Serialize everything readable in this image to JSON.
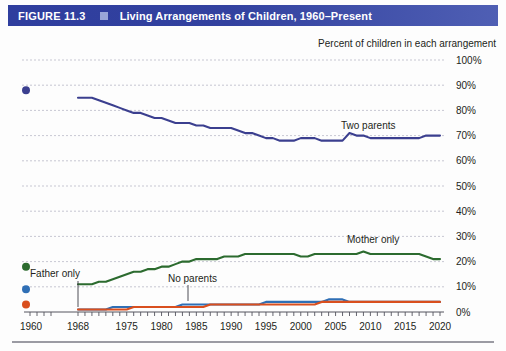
{
  "header": {
    "figure_number": "FIGURE 11.3",
    "bullet_icon": "square-bullet-icon",
    "title": "Living Arrangements of Children, 1960–Present",
    "band_color": "#32419f",
    "bullet_color": "#9aa7d8",
    "text_color": "#ffffff"
  },
  "subtitle": "Percent of children in each arrangement",
  "annotations": {
    "two_parents": "Two parents",
    "mother_only": "Mother only",
    "father_only": "Father only",
    "no_parents": "No parents"
  },
  "chart_data": {
    "type": "line",
    "title": "Living Arrangements of Children, 1960–Present",
    "subtitle": "Percent of children in each arrangement",
    "xlabel": "",
    "ylabel": "Percent of children in each arrangement",
    "ylim": [
      0,
      100
    ],
    "ytick_labels": [
      "0%",
      "10%",
      "20%",
      "30%",
      "40%",
      "50%",
      "60%",
      "70%",
      "80%",
      "90%",
      "100%"
    ],
    "ytick_values": [
      0,
      10,
      20,
      30,
      40,
      50,
      60,
      70,
      80,
      90,
      100
    ],
    "xtick_labels": [
      "1960",
      "1968",
      "1975",
      "1980",
      "1985",
      "1990",
      "1995",
      "2000",
      "2005",
      "2010",
      "2015",
      "2020"
    ],
    "xtick_values": [
      1960,
      1968,
      1975,
      1980,
      1985,
      1990,
      1995,
      2000,
      2005,
      2010,
      2015,
      2020
    ],
    "axis_break": "gap between 1960 and 1968",
    "grid": "horizontal dotted gridlines only",
    "legend_position": "inline annotations on plot",
    "colors": {
      "two_parents": "#3b3f8f",
      "mother_only": "#2c6b2f",
      "father_only": "#2f6fb5",
      "no_parents": "#d94f1e"
    },
    "isolated_1960_points": [
      {
        "series": "Two parents",
        "year": 1960,
        "value": 88
      },
      {
        "series": "Mother only",
        "year": 1960,
        "value": 18
      },
      {
        "series": "Father only",
        "year": 1960,
        "value": 9
      },
      {
        "series": "No parents",
        "year": 1960,
        "value": 3
      }
    ],
    "x": [
      1968,
      1969,
      1970,
      1971,
      1972,
      1973,
      1974,
      1975,
      1976,
      1977,
      1978,
      1979,
      1980,
      1981,
      1982,
      1983,
      1984,
      1985,
      1986,
      1987,
      1988,
      1989,
      1990,
      1991,
      1992,
      1993,
      1994,
      1995,
      1996,
      1997,
      1998,
      1999,
      2000,
      2001,
      2002,
      2003,
      2004,
      2005,
      2006,
      2007,
      2008,
      2009,
      2010,
      2011,
      2012,
      2013,
      2014,
      2015,
      2016,
      2017,
      2018,
      2019,
      2020
    ],
    "series": [
      {
        "name": "Two parents",
        "color": "#3b3f8f",
        "values": [
          85,
          85,
          85,
          84,
          83,
          82,
          81,
          80,
          79,
          79,
          78,
          77,
          77,
          76,
          75,
          75,
          75,
          74,
          74,
          73,
          73,
          73,
          73,
          72,
          71,
          71,
          70,
          69,
          69,
          68,
          68,
          68,
          69,
          69,
          69,
          68,
          68,
          68,
          68,
          71,
          70,
          70,
          69,
          69,
          69,
          69,
          69,
          69,
          69,
          69,
          70,
          70,
          70
        ]
      },
      {
        "name": "Mother only",
        "color": "#2c6b2f",
        "values": [
          11,
          11,
          11,
          12,
          12,
          13,
          14,
          15,
          16,
          16,
          17,
          17,
          18,
          18,
          19,
          20,
          20,
          21,
          21,
          21,
          21,
          22,
          22,
          22,
          23,
          23,
          23,
          23,
          23,
          23,
          23,
          23,
          22,
          22,
          23,
          23,
          23,
          23,
          23,
          23,
          23,
          24,
          23,
          23,
          23,
          23,
          23,
          23,
          23,
          23,
          22,
          21,
          21
        ]
      },
      {
        "name": "Father only",
        "color": "#2f6fb5",
        "values": [
          1,
          1,
          1,
          1,
          1,
          2,
          2,
          2,
          2,
          2,
          2,
          2,
          2,
          2,
          2,
          3,
          3,
          3,
          3,
          3,
          3,
          3,
          3,
          3,
          3,
          3,
          3,
          4,
          4,
          4,
          4,
          4,
          4,
          4,
          4,
          4,
          5,
          5,
          5,
          4,
          4,
          4,
          4,
          4,
          4,
          4,
          4,
          4,
          4,
          4,
          4,
          4,
          4
        ]
      },
      {
        "name": "No parents",
        "color": "#d94f1e",
        "values": [
          1,
          1,
          1,
          1,
          1,
          1,
          1,
          1,
          2,
          2,
          2,
          2,
          2,
          2,
          2,
          2,
          2,
          2,
          2,
          3,
          3,
          3,
          3,
          3,
          3,
          3,
          3,
          3,
          3,
          3,
          3,
          3,
          3,
          3,
          3,
          4,
          4,
          4,
          4,
          4,
          4,
          4,
          4,
          4,
          4,
          4,
          4,
          4,
          4,
          4,
          4,
          4,
          4
        ]
      }
    ]
  }
}
